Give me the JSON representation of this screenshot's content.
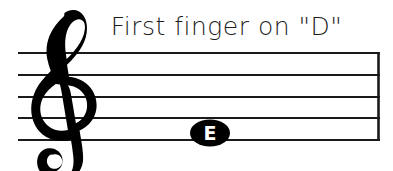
{
  "page": {
    "background_color": "#ffffff",
    "ink_color": "#000000",
    "width": 393,
    "height": 171
  },
  "title": {
    "text": "First finger on \"D\"",
    "color": "#1c1c1c"
  },
  "notation": {
    "clef": {
      "name": "treble-clef",
      "glyph": "G-clef"
    },
    "staff": {
      "line_count": 5,
      "line_ys": [
        53,
        75,
        97,
        118,
        140
      ],
      "left_x": 18,
      "right_x": 380,
      "line_color": "#1a1a1a"
    },
    "barline": {
      "name": "final-barline",
      "x": 378
    },
    "notes": [
      {
        "name": "notehead-e",
        "letter": "E",
        "letter_color": "#ffffff",
        "head_color": "#000000",
        "center_x": 210,
        "center_y": 133,
        "staff_position": "bottom-line"
      }
    ]
  }
}
